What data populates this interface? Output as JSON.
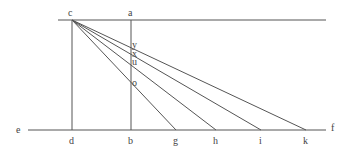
{
  "diagram": {
    "type": "geometry-construction",
    "line_color": "#555555",
    "points": {
      "c": {
        "label": "c",
        "x": 72,
        "y": 20
      },
      "a": {
        "label": "a",
        "x": 131,
        "y": 20
      },
      "e": {
        "label": "e",
        "x": 28,
        "y": 130
      },
      "f": {
        "label": "f",
        "x": 326,
        "y": 130
      },
      "d": {
        "label": "d",
        "x": 72,
        "y": 130
      },
      "b": {
        "label": "b",
        "x": 131,
        "y": 130
      },
      "g": {
        "label": "g",
        "x": 176,
        "y": 130
      },
      "h": {
        "label": "h",
        "x": 216,
        "y": 130
      },
      "i": {
        "label": "i",
        "x": 261,
        "y": 130
      },
      "k": {
        "label": "k",
        "x": 306,
        "y": 130
      },
      "y": {
        "label": "y",
        "x": 131,
        "y": 46
      },
      "x": {
        "label": "x",
        "x": 131,
        "y": 54
      },
      "u": {
        "label": "u",
        "x": 131,
        "y": 63
      },
      "o": {
        "label": "o",
        "x": 131,
        "y": 84
      }
    },
    "segments": [
      [
        "top-line",
        58,
        20,
        326,
        20
      ],
      [
        "ef",
        28,
        130,
        326,
        130
      ],
      [
        "cd",
        72,
        20,
        72,
        130
      ],
      [
        "ab",
        131,
        20,
        131,
        130
      ],
      [
        "cg",
        72,
        20,
        176,
        130
      ],
      [
        "ch",
        72,
        20,
        216,
        130
      ],
      [
        "ci",
        72,
        20,
        261,
        130
      ],
      [
        "ck",
        72,
        20,
        306,
        130
      ]
    ]
  }
}
